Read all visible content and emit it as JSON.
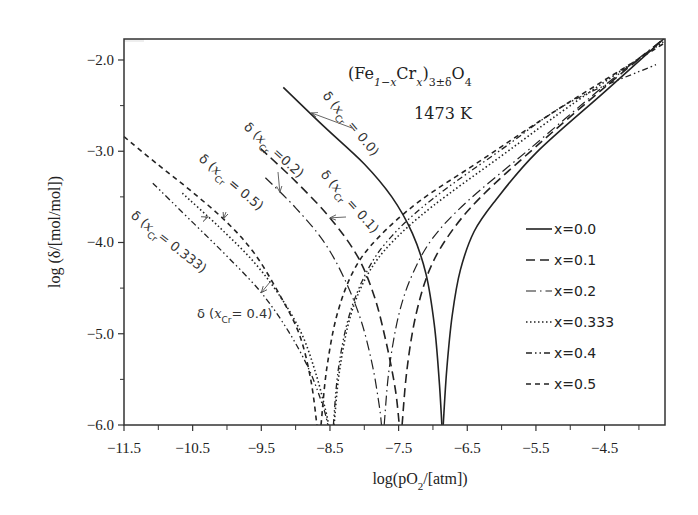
{
  "chart_data": {
    "type": "line",
    "formula": {
      "base1": "(Fe",
      "sub1": "1−x",
      "base2": "Cr",
      "sub2": "x",
      "base3": ")",
      "sub3": "3±δ",
      "base4": "O",
      "sub4": "4"
    },
    "temperature_label": "1473 K",
    "xlabel": "log(pO2/[atm])",
    "xlabel_parts": {
      "pre": "log(pO",
      "sub": "2",
      "post": "/[atm])"
    },
    "ylabel": "log (δ/[mol/mol])",
    "xlim": [
      -11.5,
      -3.62
    ],
    "ylim": [
      -6.0,
      -1.77
    ],
    "xticks": [
      -11.5,
      -10.5,
      -9.5,
      -8.5,
      -7.5,
      -6.5,
      -5.5,
      -4.5
    ],
    "xtick_labels": [
      "−11.5",
      "−10.5",
      "−9.5",
      "−8.5",
      "−7.5",
      "−6.5",
      "−5.5",
      "−4.5"
    ],
    "xminor": [
      -11.0,
      -10.0,
      -9.0,
      -8.0,
      -7.0,
      -6.0,
      -5.0,
      -4.0
    ],
    "yticks": [
      -2.0,
      -3.0,
      -4.0,
      -5.0,
      -6.0
    ],
    "ytick_labels": [
      "−2.0",
      "−3.0",
      "−4.0",
      "−5.0",
      "−6.0"
    ],
    "yminor": [
      -2.5,
      -3.5,
      -4.5,
      -5.5
    ],
    "grid": false,
    "legend_position": "right",
    "series": [
      {
        "name": "x=0.0",
        "style": "solid",
        "dip_x": -6.86,
        "left_branch": [
          [
            -9.18,
            -2.3
          ],
          [
            -8.6,
            -2.72
          ],
          [
            -8.0,
            -3.14
          ],
          [
            -7.6,
            -3.5
          ],
          [
            -7.3,
            -3.9
          ],
          [
            -7.1,
            -4.35
          ],
          [
            -6.98,
            -4.9
          ],
          [
            -6.91,
            -5.5
          ],
          [
            -6.87,
            -6.0
          ]
        ],
        "right_branch": [
          [
            -6.85,
            -6.0
          ],
          [
            -6.8,
            -5.4
          ],
          [
            -6.72,
            -4.8
          ],
          [
            -6.6,
            -4.3
          ],
          [
            -6.4,
            -3.88
          ],
          [
            -6.1,
            -3.55
          ],
          [
            -5.5,
            -3.02
          ],
          [
            -4.5,
            -2.35
          ],
          [
            -3.64,
            -1.77
          ]
        ]
      },
      {
        "name": "x=0.1",
        "style": "dashed",
        "dip_x": -7.47,
        "left_branch": [
          [
            -9.51,
            -2.97
          ],
          [
            -9.0,
            -3.33
          ],
          [
            -8.5,
            -3.73
          ],
          [
            -8.1,
            -4.15
          ],
          [
            -7.85,
            -4.6
          ],
          [
            -7.68,
            -5.1
          ],
          [
            -7.55,
            -5.6
          ],
          [
            -7.49,
            -6.0
          ]
        ],
        "right_branch": [
          [
            -7.45,
            -6.0
          ],
          [
            -7.38,
            -5.4
          ],
          [
            -7.25,
            -4.8
          ],
          [
            -7.05,
            -4.3
          ],
          [
            -6.75,
            -3.9
          ],
          [
            -6.3,
            -3.5
          ],
          [
            -5.5,
            -2.95
          ],
          [
            -4.5,
            -2.3
          ],
          [
            -3.64,
            -1.77
          ]
        ]
      },
      {
        "name": "x=0.2",
        "style": "dashdot",
        "dip_x": -7.73,
        "left_branch": [
          [
            -9.44,
            -3.29
          ],
          [
            -9.0,
            -3.62
          ],
          [
            -8.6,
            -3.98
          ],
          [
            -8.3,
            -4.38
          ],
          [
            -8.05,
            -4.85
          ],
          [
            -7.88,
            -5.35
          ],
          [
            -7.78,
            -5.8
          ],
          [
            -7.75,
            -6.0
          ]
        ],
        "right_branch": [
          [
            -7.71,
            -6.0
          ],
          [
            -7.64,
            -5.4
          ],
          [
            -7.5,
            -4.8
          ],
          [
            -7.3,
            -4.35
          ],
          [
            -7.0,
            -3.95
          ],
          [
            -6.5,
            -3.55
          ],
          [
            -5.6,
            -2.98
          ],
          [
            -4.5,
            -2.28
          ],
          [
            -3.64,
            -1.77
          ]
        ]
      },
      {
        "name": "x=0.333",
        "style": "dotted",
        "dip_x": -8.47,
        "left_branch": [
          [
            -10.65,
            -3.46
          ],
          [
            -10.1,
            -3.84
          ],
          [
            -9.6,
            -4.22
          ],
          [
            -9.2,
            -4.62
          ],
          [
            -8.9,
            -5.02
          ],
          [
            -8.7,
            -5.45
          ],
          [
            -8.56,
            -5.85
          ],
          [
            -8.52,
            -6.0
          ]
        ],
        "right_branch": [
          [
            -8.44,
            -6.0
          ],
          [
            -8.36,
            -5.4
          ],
          [
            -8.2,
            -4.8
          ],
          [
            -7.95,
            -4.35
          ],
          [
            -7.6,
            -4.0
          ],
          [
            -7.0,
            -3.6
          ],
          [
            -6.0,
            -3.05
          ],
          [
            -5.0,
            -2.5
          ],
          [
            -3.64,
            -1.8
          ]
        ]
      },
      {
        "name": "x=0.4",
        "style": "dashdotdot",
        "dip_x": -8.47,
        "left_branch": [
          [
            -11.08,
            -3.35
          ],
          [
            -10.5,
            -3.78
          ],
          [
            -10.0,
            -4.15
          ],
          [
            -9.5,
            -4.55
          ],
          [
            -9.1,
            -4.98
          ],
          [
            -8.8,
            -5.4
          ],
          [
            -8.6,
            -5.8
          ],
          [
            -8.53,
            -6.0
          ]
        ],
        "right_branch": [
          [
            -8.45,
            -6.0
          ],
          [
            -8.38,
            -5.4
          ],
          [
            -8.22,
            -4.8
          ],
          [
            -7.95,
            -4.3
          ],
          [
            -7.6,
            -3.93
          ],
          [
            -7.0,
            -3.52
          ],
          [
            -6.0,
            -2.98
          ],
          [
            -5.0,
            -2.46
          ],
          [
            -3.75,
            -2.05
          ]
        ]
      },
      {
        "name": "x=0.5",
        "style": "shortdash",
        "dip_x": -8.66,
        "left_branch": [
          [
            -11.5,
            -2.84
          ],
          [
            -11.0,
            -3.15
          ],
          [
            -10.5,
            -3.45
          ],
          [
            -10.0,
            -3.78
          ],
          [
            -9.6,
            -4.12
          ],
          [
            -9.25,
            -4.55
          ],
          [
            -8.95,
            -5.0
          ],
          [
            -8.78,
            -5.5
          ],
          [
            -8.69,
            -6.0
          ]
        ],
        "right_branch": [
          [
            -8.63,
            -6.0
          ],
          [
            -8.55,
            -5.4
          ],
          [
            -8.4,
            -4.8
          ],
          [
            -8.15,
            -4.3
          ],
          [
            -7.8,
            -3.95
          ],
          [
            -7.2,
            -3.55
          ],
          [
            -6.3,
            -3.1
          ],
          [
            -5.2,
            -2.55
          ],
          [
            -3.64,
            -1.82
          ]
        ]
      }
    ],
    "annotations": [
      {
        "text_pre": "δ (",
        "var": "x",
        "sub": "Cr",
        "text_post": " = 0.0)",
        "series": "x=0.0",
        "arrow_to": [
          -8.77,
          -2.58
        ]
      },
      {
        "text_pre": "δ (",
        "var": "x",
        "sub": "Cr",
        "text_post": " =0.2)",
        "series": "x=0.2",
        "arrow_to": [
          -9.23,
          -3.45
        ]
      },
      {
        "text_pre": "δ (",
        "var": "x",
        "sub": "Cr",
        "text_post": " = 0.1)",
        "series": "x=0.1",
        "arrow_to": [
          -8.5,
          -3.73
        ]
      },
      {
        "text_pre": "δ (",
        "var": "x",
        "sub": "Cr",
        "text_post": " = 0.5)",
        "series": "x=0.5",
        "arrow_to": [
          -10.05,
          -3.74
        ]
      },
      {
        "text_pre": "δ (",
        "var": "x",
        "sub": "Cr",
        "text_post": "= 0.333)",
        "series": "x=0.333",
        "arrow_to": [
          -10.28,
          -3.72
        ]
      },
      {
        "text_pre": "δ (",
        "var": "x",
        "sub": "Cr",
        "text_post": "= 0.4)",
        "series": "x=0.4",
        "arrow_to": [
          -9.5,
          -4.55
        ]
      }
    ]
  }
}
